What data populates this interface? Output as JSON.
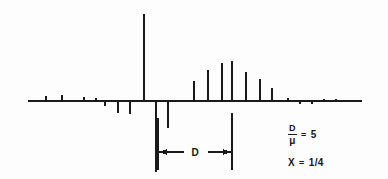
{
  "figure": {
    "background_color": "#fdfdfd",
    "ink_color": "#1a1a1a"
  },
  "annotations": {
    "ratio": {
      "numerator": "D",
      "denominator": "μ",
      "equals": "=",
      "value": "5"
    },
    "chi": {
      "symbol": "X",
      "equals": "=",
      "value": "1/4"
    },
    "interval_label": "D",
    "interval_dot": "·"
  },
  "chart_data": {
    "type": "bar",
    "xlabel": "",
    "ylabel": "",
    "grid": false,
    "legend": null,
    "baseline_y": 101,
    "axis_x_range": [
      28,
      362
    ],
    "ylim": [
      -76,
      88
    ],
    "series": [
      {
        "name": "noise-ticks-left",
        "description": "small upward ticks left of the main line",
        "x": [
          46,
          62,
          84,
          96
        ],
        "values": [
          5,
          6,
          4,
          3
        ]
      },
      {
        "name": "downward-ticks-left",
        "description": "short downward ticks left of the main line",
        "x": [
          105,
          118,
          130
        ],
        "values": [
          -5,
          -12,
          -13
        ]
      },
      {
        "name": "main-line",
        "description": "tall central spectral line",
        "x": [
          144
        ],
        "values": [
          87
        ]
      },
      {
        "name": "downward-lines",
        "description": "lines extending below the baseline near the main line",
        "x": [
          156,
          168
        ],
        "values": [
          -71,
          -27
        ]
      },
      {
        "name": "satellite-cluster",
        "description": "bell-shaped envelope of satellite lines to the right",
        "x": [
          194,
          208,
          222,
          232,
          246,
          260,
          272
        ],
        "values": [
          20,
          31,
          38,
          40,
          29,
          22,
          13
        ]
      },
      {
        "name": "noise-ticks-right",
        "description": "small ticks right of the satellite cluster",
        "x": [
          272,
          288,
          300,
          312,
          324,
          336,
          350
        ],
        "values": [
          7,
          3,
          -3,
          -3,
          2,
          2,
          2
        ]
      }
    ],
    "reference_lines": {
      "left_x": 156,
      "right_x": 232,
      "top_y": 101,
      "bottom_y": 172
    },
    "interval_arrow": {
      "from_x": 158,
      "to_x": 230,
      "y": 152,
      "label": "D"
    }
  }
}
